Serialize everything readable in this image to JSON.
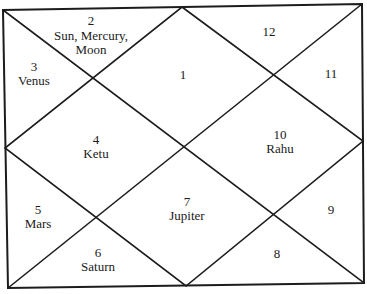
{
  "chart": {
    "style": "north-indian",
    "line_color": "#1c1c1c",
    "text_color": "#1a1a1a",
    "background": "#ffffff"
  },
  "houses": [
    {
      "number": "1",
      "planets": []
    },
    {
      "number": "2",
      "planets": [
        "Sun, Mercury,",
        "Moon"
      ]
    },
    {
      "number": "3",
      "planets": [
        "Venus"
      ]
    },
    {
      "number": "4",
      "planets": [
        "Ketu"
      ]
    },
    {
      "number": "5",
      "planets": [
        "Mars"
      ]
    },
    {
      "number": "6",
      "planets": [
        "Saturn"
      ]
    },
    {
      "number": "7",
      "planets": [
        "Jupiter"
      ]
    },
    {
      "number": "8",
      "planets": []
    },
    {
      "number": "9",
      "planets": []
    },
    {
      "number": "10",
      "planets": [
        "Rahu"
      ]
    },
    {
      "number": "11",
      "planets": []
    },
    {
      "number": "12",
      "planets": []
    }
  ]
}
